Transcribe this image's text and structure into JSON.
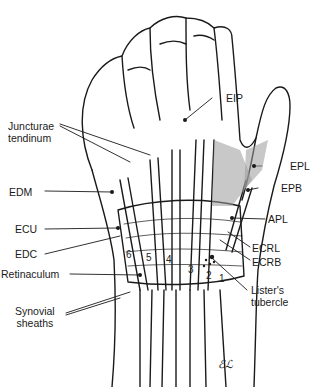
{
  "figure": {
    "labels": {
      "juncturae": [
        "Juncturae",
        "tendinum"
      ],
      "eip": "EIP",
      "edm": "EDM",
      "ecu": "ECU",
      "edc": "EDC",
      "retinaculum": "Retinaculum",
      "synovial": [
        "Synovial",
        "sheaths"
      ],
      "epl": "EPL",
      "epb": "EPB",
      "apl": "APL",
      "ecrl": "ECRL",
      "ecrb": "ECRB",
      "listers": [
        "Lister's",
        "tubercle"
      ]
    },
    "compartment_numbers": [
      "6",
      "5",
      "4",
      "3",
      "2",
      "1"
    ],
    "signature": "ℰℒ"
  },
  "colors": {
    "ink": "#1a1a1a",
    "shade": "#9a9a9a",
    "background": "#ffffff"
  }
}
